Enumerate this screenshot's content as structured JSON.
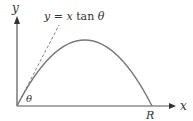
{
  "diagram": {
    "type": "projectile-motion",
    "labels": {
      "y_axis": "y",
      "x_axis": "x",
      "tangent_line": "y = x tan θ",
      "tangent_line_parts": {
        "lhs": "y",
        "eq": " = ",
        "x": "x",
        "fn": " tan ",
        "theta": "θ"
      },
      "angle": "θ",
      "range": "R"
    },
    "colors": {
      "axes": "#555555",
      "curve": "#777777",
      "dashed": "#888888",
      "text": "#333333"
    },
    "geometry": {
      "origin": [
        17,
        106
      ],
      "x_axis_end": [
        176,
        106
      ],
      "y_axis_end": [
        17,
        16
      ],
      "peak": [
        85,
        40
      ],
      "range_point": [
        152,
        106
      ],
      "tangent_end": [
        59,
        25
      ]
    }
  }
}
